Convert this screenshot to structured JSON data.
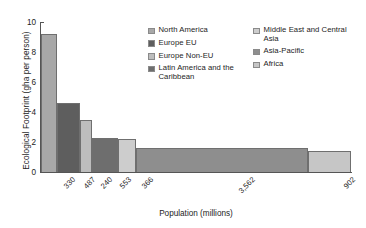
{
  "chart_data": {
    "type": "bar",
    "title": "",
    "xlabel": "Population (millions)",
    "ylabel": "Ecological Footprint (gha per person)",
    "ylim": [
      0,
      10
    ],
    "yticks": [
      "0",
      "2",
      "4",
      "6",
      "8",
      "10"
    ],
    "grid": false,
    "legend_position": "top-right",
    "note": "Bar widths are proportional to population (millions); bar heights are ecological footprint in gha per person.",
    "categories": [
      "North America",
      "Europe EU",
      "Europe Non-EU",
      "Latin America and the Caribbean",
      "Middle East and Central Asia",
      "Asia-Pacific",
      "Africa"
    ],
    "x": [
      330,
      487,
      240,
      553,
      366,
      3562,
      902
    ],
    "xtick_labels": [
      "330",
      "487",
      "240",
      "553",
      "366",
      "3,562",
      "902"
    ],
    "values": [
      9.2,
      4.6,
      3.5,
      2.25,
      2.2,
      1.6,
      1.4
    ],
    "colors": [
      "#a8a8a8",
      "#5e5e5e",
      "#bdbdbd",
      "#6e6e6e",
      "#cdcdcd",
      "#8e8e8e",
      "#c6c6c6"
    ]
  },
  "axes": {
    "y_title": "Ecological Footprint (gha per person)",
    "x_title": "Population (millions)",
    "y_ticks": [
      {
        "label": "10",
        "value": 10
      },
      {
        "label": "8",
        "value": 8
      },
      {
        "label": "6",
        "value": 6
      },
      {
        "label": "4",
        "value": 4
      },
      {
        "label": "2",
        "value": 2
      },
      {
        "label": "0",
        "value": 0
      }
    ]
  },
  "legend": {
    "column_1": [
      {
        "label": "North America",
        "color": "#a8a8a8"
      },
      {
        "label": "Europe EU",
        "color": "#5e5e5e"
      },
      {
        "label": "Europe Non-EU",
        "color": "#bdbdbd"
      },
      {
        "label": "Latin America and the Caribbean",
        "color": "#6e6e6e"
      }
    ],
    "column_2": [
      {
        "label": "Middle East and Central Asia",
        "color": "#cdcdcd"
      },
      {
        "label": "Asia-Pacific",
        "color": "#8e8e8e"
      },
      {
        "label": "Africa",
        "color": "#c6c6c6"
      }
    ]
  }
}
